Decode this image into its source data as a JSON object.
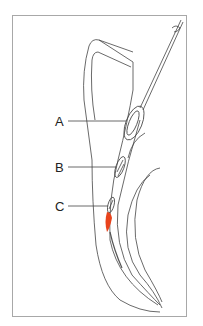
{
  "figure": {
    "labels": [
      {
        "id": "A",
        "text": "A"
      },
      {
        "id": "B",
        "text": "B"
      },
      {
        "id": "C",
        "text": "C"
      }
    ],
    "colors": {
      "outline": "#444444",
      "frame": "#a8a8a8",
      "highlight": "#e8431c"
    }
  }
}
